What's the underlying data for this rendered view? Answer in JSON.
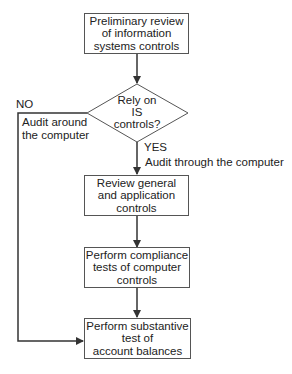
{
  "flowchart": {
    "nodes": {
      "preliminary_review": {
        "text": "Preliminary review\nof information\nsystems controls",
        "lines": [
          "Preliminary review",
          "of information",
          "systems controls"
        ]
      },
      "decision": {
        "lines": [
          "Rely on",
          "IS",
          "controls?"
        ]
      },
      "review_controls": {
        "lines": [
          "Review general",
          "and application",
          "controls"
        ]
      },
      "compliance_tests": {
        "lines": [
          "Perform compliance",
          "tests of computer",
          "controls"
        ]
      },
      "substantive_test": {
        "lines": [
          "Perform substantive",
          "test of",
          "account balances"
        ]
      }
    },
    "edge_labels": {
      "no": "NO",
      "no_desc": [
        "Audit around",
        "the computer"
      ],
      "yes": "YES",
      "yes_desc": "Audit through the computer"
    },
    "colors": {
      "line": "#333333",
      "border": "#555555",
      "text": "#222222"
    }
  }
}
